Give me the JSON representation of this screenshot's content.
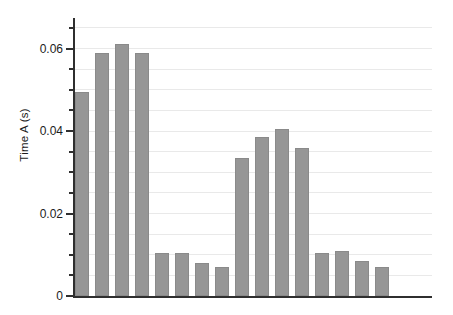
{
  "figure": {
    "width": 453,
    "height": 315,
    "background": "#ffffff"
  },
  "chart_data": {
    "type": "bar",
    "title": "",
    "xlabel": "",
    "ylabel": "Time A (s)",
    "values": [
      0.0495,
      0.059,
      0.061,
      0.059,
      0.0105,
      0.0105,
      0.008,
      0.007,
      0.0335,
      0.0385,
      0.0405,
      0.036,
      0.0105,
      0.011,
      0.0085,
      0.007
    ],
    "ylim": [
      0,
      0.0674
    ],
    "yticks": {
      "major": [
        0,
        0.02,
        0.04,
        0.06
      ],
      "major_labels": [
        "0",
        "0.02",
        "0.04",
        "0.06"
      ],
      "minor_step": 0.005
    },
    "x_tick_labels": "none",
    "grid": {
      "visible": true,
      "step": 0.005,
      "color": "#e9e9e9"
    },
    "legend": "none",
    "colors": {
      "bar_fill": "#969696",
      "bar_edge": "#8a8a8a",
      "axis": "#2f2f2f",
      "tick_label": "#1c1c1c"
    }
  }
}
